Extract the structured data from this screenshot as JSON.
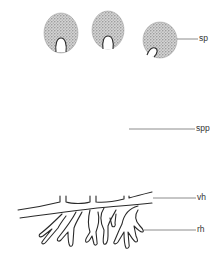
{
  "diagram": {
    "colors": {
      "outline": "#2a2a2a",
      "sporangium_fill": "#bdbdbd",
      "leader_line": "#6e6e6e",
      "label_text": "#333333",
      "background": "#ffffff"
    },
    "labels": [
      {
        "id": "sp",
        "text": "sp",
        "meaning": "sporangium"
      },
      {
        "id": "spp",
        "text": "spp",
        "meaning": "sporangiophore"
      },
      {
        "id": "vh",
        "text": "vh",
        "meaning": "vegetative hypha (stolon)"
      },
      {
        "id": "rh",
        "text": "rh",
        "meaning": "rhizoids"
      }
    ],
    "components": {
      "sporangia_count": 3,
      "sporangiophores_count": 3,
      "rhizoid_clusters_count": 5
    }
  }
}
